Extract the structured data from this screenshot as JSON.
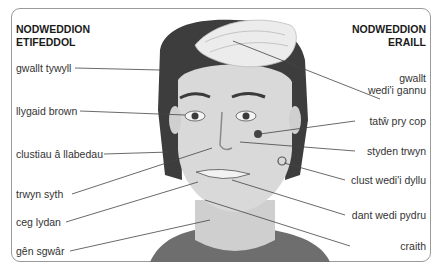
{
  "headings": {
    "left": [
      "NODWEDDION",
      "ETIFEDDOL"
    ],
    "right": [
      "NODWEDDION",
      "ERAILL"
    ]
  },
  "labels_left": [
    {
      "text": "gwallt tywyll"
    },
    {
      "text": "llygaid brown"
    },
    {
      "text": "clustiau â llabedau"
    },
    {
      "text": "trwyn syth"
    },
    {
      "text": "ceg lydan"
    },
    {
      "text": "gên sgwâr"
    }
  ],
  "labels_right": [
    {
      "text": "gwallt",
      "text2": "wedi'i gannu"
    },
    {
      "text": "tatŵ pry cop"
    },
    {
      "text": "styden trwyn"
    },
    {
      "text": "clust wedi'i dyllu"
    },
    {
      "text": "dant wedi pydru"
    },
    {
      "text": "craith"
    }
  ],
  "colors": {
    "frame": "#9a9a9a",
    "line": "#444444",
    "hair_dark": "#3a3a3a",
    "hair_bleached": "#e8e8e8",
    "skin": "#d8d8d8"
  }
}
